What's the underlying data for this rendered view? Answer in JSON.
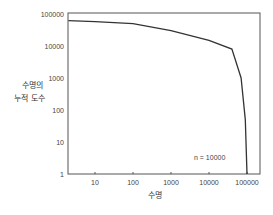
{
  "chart_data": {
    "type": "line",
    "title": "",
    "xlabel": "수명",
    "ylabel": "수명의 누적 도수",
    "ylabel_lines": [
      "수명의",
      "누적 도수"
    ],
    "x_scale": "log",
    "y_scale": "log",
    "xlim": [
      2,
      250000
    ],
    "ylim": [
      1,
      100000
    ],
    "x_ticks": [
      "10",
      "100",
      "1000",
      "10000",
      "100000"
    ],
    "y_ticks": [
      "1",
      "10",
      "100",
      "1000",
      "10000",
      "100000"
    ],
    "annotation": "n = 10000",
    "grid": false,
    "series": [
      {
        "name": "cumulative frequency",
        "x": [
          2,
          10,
          100,
          1000,
          10000,
          40000,
          70000,
          90000,
          100000
        ],
        "y": [
          62000,
          58000,
          50000,
          30000,
          15000,
          8000,
          1000,
          50,
          1
        ]
      }
    ]
  }
}
